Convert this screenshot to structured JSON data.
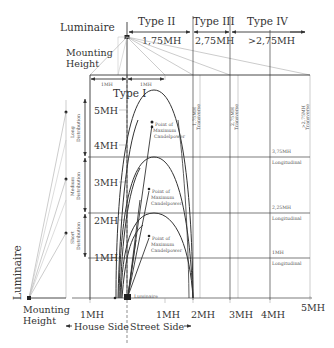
{
  "diagram": {
    "top_labels": {
      "luminaire": "Luminaire",
      "mounting_height": [
        "Mounting",
        "Height"
      ],
      "type2": "Type II",
      "type3": "Type  III",
      "type4": "Type  IV",
      "type2_range": "1,75MH",
      "type3_range": "2,75MH",
      "type4_range": ">2,75MH",
      "type1": "Type I",
      "type1_left_width": "1MH",
      "type1_right_width": "1MH"
    },
    "y_axis": {
      "ticks": [
        "5MH",
        "4MH",
        "3MH",
        "2MH",
        "1MH"
      ]
    },
    "x_axis": {
      "ticks": [
        "1MH",
        "1MH",
        "2MH",
        "3MH",
        "4MH",
        "5MH"
      ],
      "house_side": "House Side",
      "street_side": "Street Side"
    },
    "distribution_labels": {
      "long": [
        "Long",
        "Distribution"
      ],
      "medium": [
        "Medium",
        "Distribution"
      ],
      "short": [
        "Short",
        "Distribution"
      ]
    },
    "transverse_labels": [
      {
        "value": "1,75MH",
        "text": "Transverse"
      },
      {
        "value": "2,75MH",
        "text": "Transverse"
      },
      {
        "value": ">2,75MH",
        "text": "Transverse"
      }
    ],
    "longitudinal_labels": [
      {
        "value": "3,75MH",
        "text": "Longitudinal"
      },
      {
        "value": "2,25MH",
        "text": "Longitudinal"
      },
      {
        "value": "1MH",
        "text": "Longitudinal"
      }
    ],
    "candlepower_labels": [
      [
        "Point of",
        "Maximum",
        "Candelpower"
      ],
      [
        "Point of",
        "Maximum",
        "Candelpower"
      ],
      [
        "Point of",
        "Maximum",
        "Candelpower"
      ]
    ],
    "bottom_labels": {
      "luminaire_small": "Luminaire",
      "left_luminaire": "Luminaire",
      "left_mounting_height": [
        "Mounting",
        "Height"
      ]
    }
  }
}
